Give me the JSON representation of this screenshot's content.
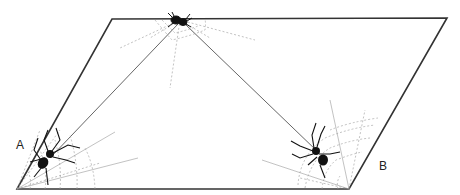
{
  "diagram": {
    "shape": "parallelogram",
    "vertices": {
      "top_left": [
        112,
        19
      ],
      "top_right": [
        447,
        18
      ],
      "bottom_right": [
        349,
        189
      ],
      "bottom_left": [
        17,
        189
      ]
    },
    "labels": {
      "A": "A",
      "B": "B"
    },
    "spiders": [
      {
        "id": "top",
        "position": [
          180,
          20
        ]
      },
      {
        "id": "A",
        "position": [
          46,
          162
        ]
      },
      {
        "id": "B",
        "position": [
          320,
          155
        ]
      }
    ],
    "threads": [
      {
        "from": "top",
        "to": "A"
      },
      {
        "from": "top",
        "to": "B"
      }
    ],
    "colors": {
      "outline": "#333333",
      "web": "#9a9a9a",
      "spider": "#111111"
    }
  }
}
